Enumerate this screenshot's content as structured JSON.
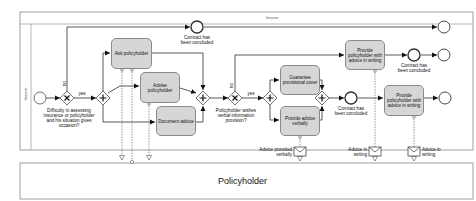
{
  "pools": {
    "insurer": {
      "header_label": "Insurer",
      "lane_label": "Insurer"
    },
    "policyholder": {
      "title": "Policyholder"
    }
  },
  "tasks": {
    "ask_policyholder": "Ask policyholder",
    "advise_policyholder": "Advise policyholder",
    "document_advice": "Document advice",
    "guarantee_cover": "Guarantee provisional cover",
    "provide_advice_verbally": "Provide advice verbally",
    "provide_writing_upper": "Provide policyholder with advice in writing",
    "provide_writing_lower": "Provide policyholder with advice in writing"
  },
  "gateways": {
    "gateway1_question": "Difficulty in assessing insurance or policyholder and his situation gives occasion?",
    "gateway1_no": "no",
    "gateway1_yes": "yes",
    "gateway2_question": "Policyholder wishes verbal information provision?",
    "gateway2_no": "no",
    "gateway2_yes": "yes",
    "exclusive_symbol": "X",
    "parallel_symbol": "+"
  },
  "events": {
    "contract_concluded_top": "Contract has been concluded",
    "contract_concluded_upper": "Contract has been concluded",
    "contract_concluded_middle": "Contract has been concluded"
  },
  "messages": {
    "advice_verbally": "Advice provided verbally",
    "advice_writing_1": "Advice in writing",
    "advice_writing_2": "Advice in writing"
  },
  "colors": {
    "task_fill": "#d6d6d6",
    "stroke": "#222222",
    "pool_border": "#888888"
  }
}
